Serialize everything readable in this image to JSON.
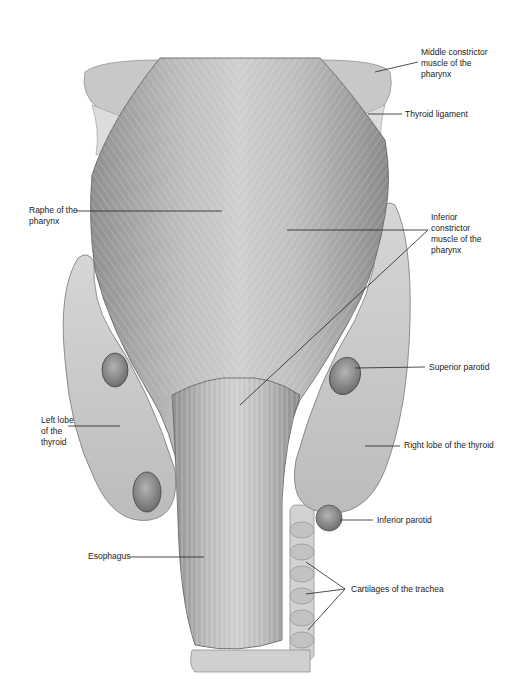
{
  "figure": {
    "labels": [
      {
        "id": "middle-constrictor",
        "text": "Middle constrictor\nmuscle of the\npharynx",
        "x": 421,
        "y": 49
      },
      {
        "id": "thyroid-ligament",
        "text": "Thyroid ligament",
        "x": 405,
        "y": 109
      },
      {
        "id": "raphe",
        "text": "Raphe of the\npharynx",
        "x": 29,
        "y": 205
      },
      {
        "id": "inferior-constrictor",
        "text": "Inferior\nconstrictor\nmuscle of the\npharynx",
        "x": 431,
        "y": 212
      },
      {
        "id": "superior-parotid",
        "text": "Superior parotid",
        "x": 429,
        "y": 362
      },
      {
        "id": "left-lobe-thyroid",
        "text": "Left lobe\nof the\nthyroid",
        "x": 41,
        "y": 415
      },
      {
        "id": "right-lobe-thyroid",
        "text": "Right lobe of the thyroid",
        "x": 404,
        "y": 440
      },
      {
        "id": "inferior-parotid",
        "text": "Inferior parotid",
        "x": 377,
        "y": 516
      },
      {
        "id": "esophagus",
        "text": "Esophagus",
        "x": 88,
        "y": 551
      },
      {
        "id": "cartilages-trachea",
        "text": "Cartilages of the trachea",
        "x": 351,
        "y": 584
      }
    ]
  }
}
